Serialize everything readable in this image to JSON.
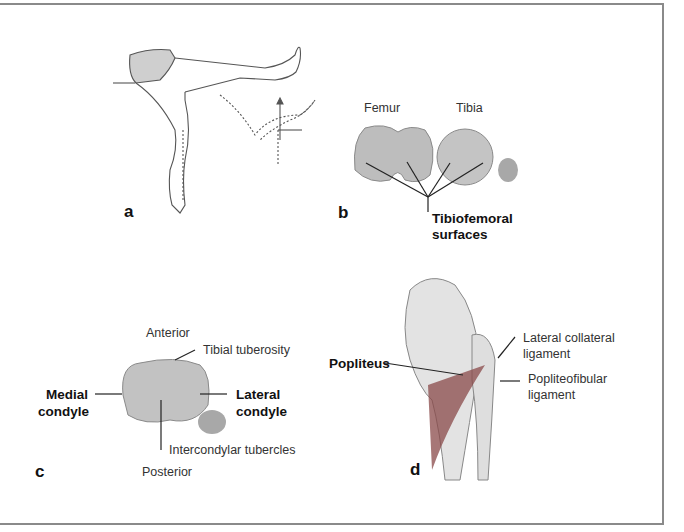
{
  "figure": {
    "panels": [
      {
        "letter": "a",
        "description": "Seated leg extension test illustration"
      },
      {
        "letter": "b",
        "labels": {
          "femur": "Femur",
          "tibia": "Tibia",
          "surfaces_line1": "Tibiofemoral",
          "surfaces_line2": "surfaces"
        }
      },
      {
        "letter": "c",
        "labels": {
          "anterior": "Anterior",
          "tibial_tuberosity": "Tibial tuberosity",
          "medial_line1": "Medial",
          "medial_line2": "condyle",
          "lateral_line1": "Lateral",
          "lateral_line2": "condyle",
          "intercondylar": "Intercondylar tubercles",
          "posterior": "Posterior"
        }
      },
      {
        "letter": "d",
        "labels": {
          "popliteus": "Popliteus",
          "lcl_line1": "Lateral collateral",
          "lcl_line2": "ligament",
          "pfl_line1": "Popliteofibular",
          "pfl_line2": "ligament"
        }
      }
    ]
  },
  "colors": {
    "border": "#8a8a8a",
    "bone": "#c9c9c9",
    "bone_dark": "#9a9a9a",
    "muscle": "#8a4a4a",
    "shorts": "#c8c8c8"
  }
}
